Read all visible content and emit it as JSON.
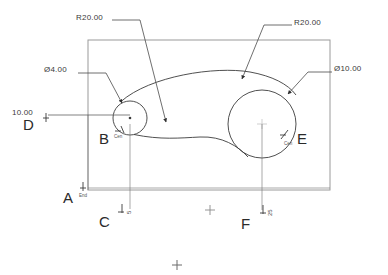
{
  "drawing": {
    "type": "cad-sketch-2d",
    "units": "mm",
    "background_color": "#ffffff",
    "geometry_color": "#3c3c3c",
    "dimension_color": "#4a4a4a",
    "construction_color": "#b9b9b9",
    "boundary_rect": {
      "name": "sketch-boundary-rectangle",
      "x": 88,
      "y": 40,
      "width": 242,
      "height": 150
    },
    "circles": [
      {
        "name": "small-circle",
        "label": "B",
        "cx": 130,
        "cy": 118,
        "r": 17,
        "diameter": 4.0
      },
      {
        "name": "large-circle",
        "label": "E",
        "cx": 262,
        "cy": 124,
        "r": 34,
        "diameter": 10.0
      }
    ],
    "arcs": [
      {
        "name": "upper-arc",
        "radius": 20.0,
        "label": "R20.00"
      },
      {
        "name": "lower-arc",
        "radius": 20.0,
        "label": "R20.00"
      }
    ]
  },
  "dimensions": {
    "radius_left": {
      "label": "R20.00",
      "value": 20.0,
      "prefix": "R",
      "x": 76,
      "y": 17
    },
    "radius_right": {
      "label": "R20.00",
      "value": 20.0,
      "prefix": "R",
      "x": 294,
      "y": 22
    },
    "diameter_small": {
      "label": "Ø4.00",
      "value": 4.0,
      "prefix": "Ø",
      "x": 44,
      "y": 69
    },
    "diameter_large": {
      "label": "Ø10.00",
      "value": 10.0,
      "prefix": "Ø",
      "x": 334,
      "y": 68
    },
    "linear_left": {
      "label": "10.00",
      "value": 10.0,
      "x": 12,
      "y": 111
    }
  },
  "reference_points": [
    {
      "name": "point-a",
      "letter": "A",
      "snap": "End",
      "x": 67,
      "y": 196,
      "marker_x": 83,
      "marker_y": 187
    },
    {
      "name": "point-b",
      "letter": "B",
      "snap": "Cen",
      "x": 101,
      "y": 136,
      "marker_x": 118,
      "marker_y": 128
    },
    {
      "name": "point-c",
      "letter": "C",
      "snap": "",
      "x": 101,
      "y": 219,
      "marker_x": 122,
      "marker_y": 208,
      "rot_value": "5"
    },
    {
      "name": "point-d",
      "letter": "D",
      "snap": "",
      "x": 25,
      "y": 122,
      "marker_x": 46,
      "marker_y": 114
    },
    {
      "name": "point-e",
      "letter": "E",
      "snap": "Cen",
      "x": 299,
      "y": 136,
      "marker_x": 284,
      "marker_y": 132
    },
    {
      "name": "point-f",
      "letter": "F",
      "snap": "",
      "x": 243,
      "y": 221,
      "marker_x": 264,
      "marker_y": 209,
      "rot_value": "25"
    }
  ],
  "markers": [
    {
      "name": "crosshair-marker-1",
      "x": 210,
      "y": 210
    },
    {
      "name": "crosshair-marker-2",
      "x": 177,
      "y": 265
    }
  ]
}
